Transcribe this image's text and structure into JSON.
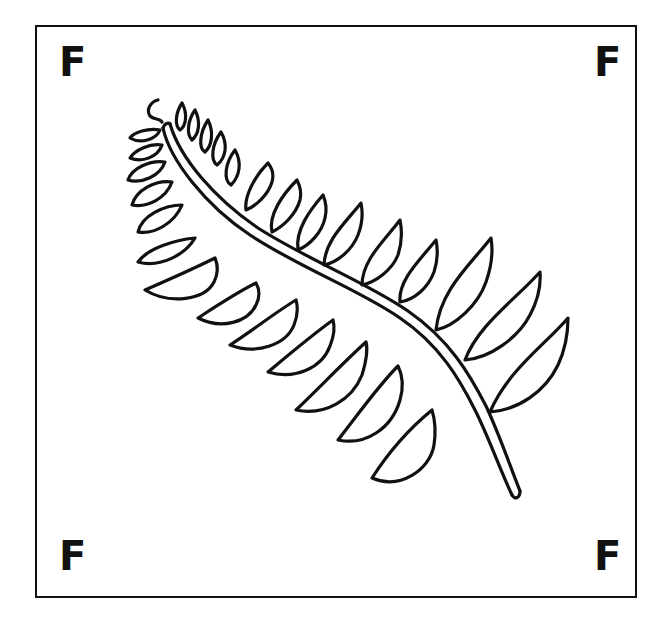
{
  "illustration": {
    "subject": "fern-frond",
    "style": "black line drawing on white",
    "corner_letters": {
      "top_left": "F",
      "top_right": "F",
      "bottom_left": "F",
      "bottom_right": "F"
    },
    "colors": {
      "ink": "#111111",
      "background": "#ffffff"
    }
  }
}
